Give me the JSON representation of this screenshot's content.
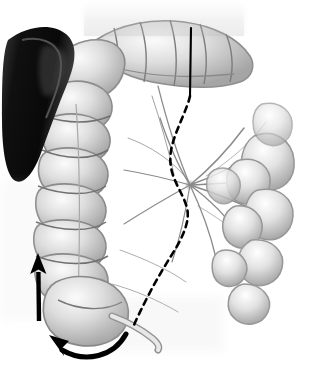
{
  "figure": {
    "style": "grayscale medical line-and-wash drawing",
    "width": 309,
    "height": 371,
    "background_color": "#ffffff"
  },
  "palette": {
    "background": "#ffffff",
    "ink_black": "#000000",
    "organ_dark": "#1a1a1a",
    "organ_mid": "#9a9a9a",
    "organ_light": "#d8d8d8",
    "organ_highlight": "#f2f2f2",
    "vessel_gray": "#8c8c8c",
    "haustra_shadow": "#787878",
    "mesentery_tint": "#c4c4c4"
  },
  "structures": [
    {
      "id": "spleen",
      "label": "Spleen",
      "note": "dark wedge-shaped organ, upper left margin",
      "tone": "#151515"
    },
    {
      "id": "transverse-colon",
      "label": "Transverse colon",
      "note": "haustrated tube crossing the top of the field",
      "tone": "#cfcfcf"
    },
    {
      "id": "hepatic-flexure",
      "label": "Hepatic flexure",
      "note": "upper-left bend joining transverse and ascending colon",
      "tone": "#c8c8c8"
    },
    {
      "id": "ascending-colon",
      "label": "Ascending colon",
      "note": "vertical haustrated segment on the left, 8 haustral sacculations",
      "tone": "#d2d2d2"
    },
    {
      "id": "cecum",
      "label": "Cecum",
      "note": "rounded blind pouch at the lower left",
      "tone": "#d6d6d6"
    },
    {
      "id": "appendix",
      "label": "Vermiform appendix",
      "note": "slender tube projecting right-downward from the cecum",
      "tone": "#dcdcdc"
    },
    {
      "id": "mesentery",
      "label": "Mesentery",
      "note": "translucent fan with radiating vessels, root near center",
      "tone": "#c4c4c4"
    },
    {
      "id": "small-bowel",
      "label": "Small bowel loops",
      "note": "coiled loops occupying the right side of the field",
      "tone": "#cdcdcd"
    },
    {
      "id": "ileocolic-vessels",
      "label": "Ileocolic / mesenteric vessels",
      "note": "branching arcade radiating from the mesenteric root",
      "tone": "#8c8c8c"
    }
  ],
  "annotations": {
    "solid_line": {
      "name": "resection-line-solid",
      "label": "Solid incision line",
      "description": "Vertical black line along the lateral peritoneal reflection, upper field",
      "color": "#000000",
      "stroke_width": 2.1,
      "start": [
        191,
        28
      ],
      "end": [
        190,
        96
      ]
    },
    "dashed_line": {
      "name": "mobilization-line-dashed",
      "label": "Dashed mobilization line",
      "description": "S-shaped dashed line continuing from the solid line down to the cecum",
      "color": "#000000",
      "stroke_width": 2.6,
      "dash_pattern": "6 5",
      "path_points": [
        [
          190,
          96
        ],
        [
          186,
          112
        ],
        [
          176,
          132
        ],
        [
          170,
          150
        ],
        [
          171,
          168
        ],
        [
          180,
          188
        ],
        [
          187,
          206
        ],
        [
          186,
          224
        ],
        [
          176,
          246
        ],
        [
          164,
          266
        ],
        [
          152,
          288
        ],
        [
          142,
          308
        ],
        [
          134,
          325
        ]
      ]
    },
    "arrows": [
      {
        "name": "ascending-mobilization-arrow",
        "label": "Upward straight arrow",
        "description": "Bold black arrow along the ascending colon pointing cephalad",
        "color": "#000000",
        "shape": "straight",
        "tail": [
          39,
          321
        ],
        "head": [
          38,
          256
        ],
        "shaft_width": 4.4,
        "head_length": 20,
        "head_width": 15
      },
      {
        "name": "cecal-rotation-arrow",
        "label": "Curved sweep arrow",
        "description": "Bold curved arrow beneath the cecum sweeping counterclockwise to the left",
        "color": "#000000",
        "shape": "curved",
        "tail": [
          126,
          334
        ],
        "control": [
          88,
          362
        ],
        "head": [
          52,
          336
        ],
        "shaft_width": 5.0,
        "head_length": 19,
        "head_width": 16
      }
    ]
  }
}
